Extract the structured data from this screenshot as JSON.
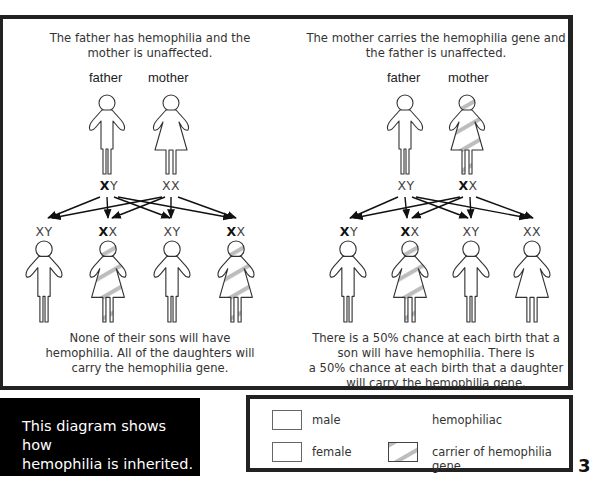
{
  "left_panel": {
    "heading_line1": "The father has hemophilia and the",
    "heading_line2": "mother is unaffected.",
    "parents": {
      "father_label": "father",
      "mother_label": "mother",
      "father_genotype": {
        "bold": "X",
        "rest": "Y"
      },
      "mother_genotype": {
        "bold": "",
        "rest": "XX"
      }
    },
    "children": [
      {
        "sex": "male",
        "genotype_bold": "",
        "genotype_rest": "XY",
        "status": "unaffected"
      },
      {
        "sex": "female",
        "genotype_bold": "X",
        "genotype_rest": "X",
        "status": "carrier"
      },
      {
        "sex": "male",
        "genotype_bold": "",
        "genotype_rest": "XY",
        "status": "unaffected"
      },
      {
        "sex": "female",
        "genotype_bold": "X",
        "genotype_rest": "X",
        "status": "carrier"
      }
    ],
    "summary_line1": "None of their sons will have",
    "summary_line2": "hemophilia. All of the daughters will",
    "summary_line3": "carry the hemophilia gene."
  },
  "right_panel": {
    "heading_line1": "The mother carries the hemophilia gene and",
    "heading_line2": "the father is unaffected.",
    "parents": {
      "father_label": "father",
      "mother_label": "mother",
      "father_genotype": {
        "bold": "",
        "rest": "XY"
      },
      "mother_genotype": {
        "bold": "X",
        "rest": "X"
      }
    },
    "children": [
      {
        "sex": "male",
        "genotype_bold": "X",
        "genotype_rest": "Y",
        "status": "hemophiliac"
      },
      {
        "sex": "female",
        "genotype_bold": "X",
        "genotype_rest": "X",
        "status": "carrier"
      },
      {
        "sex": "male",
        "genotype_bold": "",
        "genotype_rest": "XY",
        "status": "unaffected"
      },
      {
        "sex": "female",
        "genotype_bold": "",
        "genotype_rest": "XX",
        "status": "unaffected"
      }
    ],
    "summary_line1": "There is a 50% chance at each birth that a",
    "summary_line2": "son will have hemophilia. There is",
    "summary_line3": "a 50% chance at each birth that a daughter",
    "summary_line4": "will carry the hemophilia gene."
  },
  "caption": {
    "line1": "This diagram shows how",
    "line2": "hemophilia is inherited."
  },
  "legend": {
    "items": [
      {
        "label": "male",
        "swatch": "plain"
      },
      {
        "label": "hemophiliac",
        "swatch": "none-visible"
      },
      {
        "label": "female",
        "swatch": "plain"
      },
      {
        "label": "carrier of hemophilia gene",
        "swatch": "striped"
      }
    ]
  },
  "colors": {
    "outline": "#333333",
    "carrier_stripe": "#bbbbbb",
    "caption_bg": "#000000",
    "caption_text": "#ffffff",
    "frame": "#222222"
  },
  "page_number_fragment": "3"
}
